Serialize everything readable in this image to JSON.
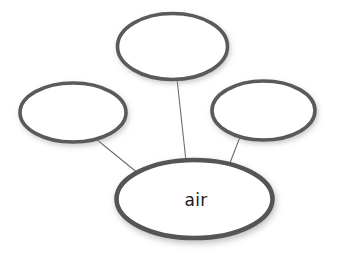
{
  "diagram": {
    "type": "concept-map",
    "background_color": "#ffffff",
    "width": 339,
    "height": 260,
    "stroke_color": "#5a5a5a",
    "central_stroke_color": "#555555",
    "connector_color": "#6e6e6e",
    "fill_color": "#ffffff",
    "text_color": "#1a1a1a",
    "central_node": {
      "id": "central",
      "label": "air",
      "cx": 194.5,
      "cy": 199,
      "rx": 78,
      "ry": 39,
      "stroke_width": 4.6,
      "has_label": true
    },
    "satellite_nodes": [
      {
        "id": "top",
        "label": "",
        "cx": 172.5,
        "cy": 46.5,
        "rx": 55,
        "ry": 33,
        "stroke_width": 3.6,
        "has_label": false
      },
      {
        "id": "left",
        "label": "",
        "cx": 73,
        "cy": 112.5,
        "rx": 53,
        "ry": 29.5,
        "stroke_width": 3.6,
        "has_label": false
      },
      {
        "id": "right",
        "label": "",
        "cx": 263.5,
        "cy": 110.5,
        "rx": 51.5,
        "ry": 29.5,
        "stroke_width": 3.6,
        "has_label": false
      }
    ],
    "connectors": [
      {
        "id": "connector-top",
        "from": "top",
        "to": "central",
        "x1": 177,
        "y1": 79,
        "x2": 186,
        "y2": 161,
        "stroke_width": 1.1
      },
      {
        "id": "connector-left",
        "from": "left",
        "to": "central",
        "x1": 96,
        "y1": 139,
        "x2": 139,
        "y2": 174,
        "stroke_width": 1.1
      },
      {
        "id": "connector-right",
        "from": "right",
        "to": "central",
        "x1": 240,
        "y1": 137,
        "x2": 228,
        "y2": 168,
        "stroke_width": 1.1
      }
    ]
  }
}
